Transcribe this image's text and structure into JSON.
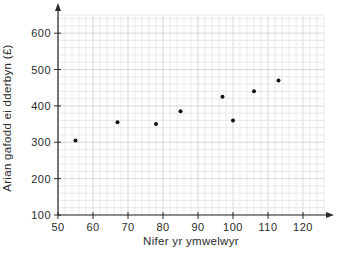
{
  "chart_data": {
    "type": "scatter",
    "title": "",
    "xlabel": "Nifer yr ymwelwyr",
    "ylabel": "Arian gafodd ei dderbyn (£)",
    "points": [
      {
        "x": 55,
        "y": 305
      },
      {
        "x": 67,
        "y": 355
      },
      {
        "x": 78,
        "y": 350
      },
      {
        "x": 85,
        "y": 385
      },
      {
        "x": 97,
        "y": 425
      },
      {
        "x": 100,
        "y": 360
      },
      {
        "x": 106,
        "y": 440
      },
      {
        "x": 113,
        "y": 470
      }
    ],
    "xlim": [
      50,
      126
    ],
    "ylim": [
      100,
      650
    ],
    "x_ticks": [
      50,
      60,
      70,
      80,
      90,
      100,
      110,
      120
    ],
    "y_ticks": [
      100,
      200,
      300,
      400,
      500,
      600
    ],
    "grid": {
      "visible": true,
      "minor_x_step": 2,
      "minor_y_step": 20,
      "major_x_step": 10,
      "major_y_step": 100
    },
    "legend": "none",
    "colors": {
      "background": "#ffffff",
      "grid_minor": "#dfdfdf",
      "grid_major": "#c8c8c8",
      "axis": "#2b2b2b",
      "text": "#2b2b2b",
      "point": "#111111"
    }
  }
}
